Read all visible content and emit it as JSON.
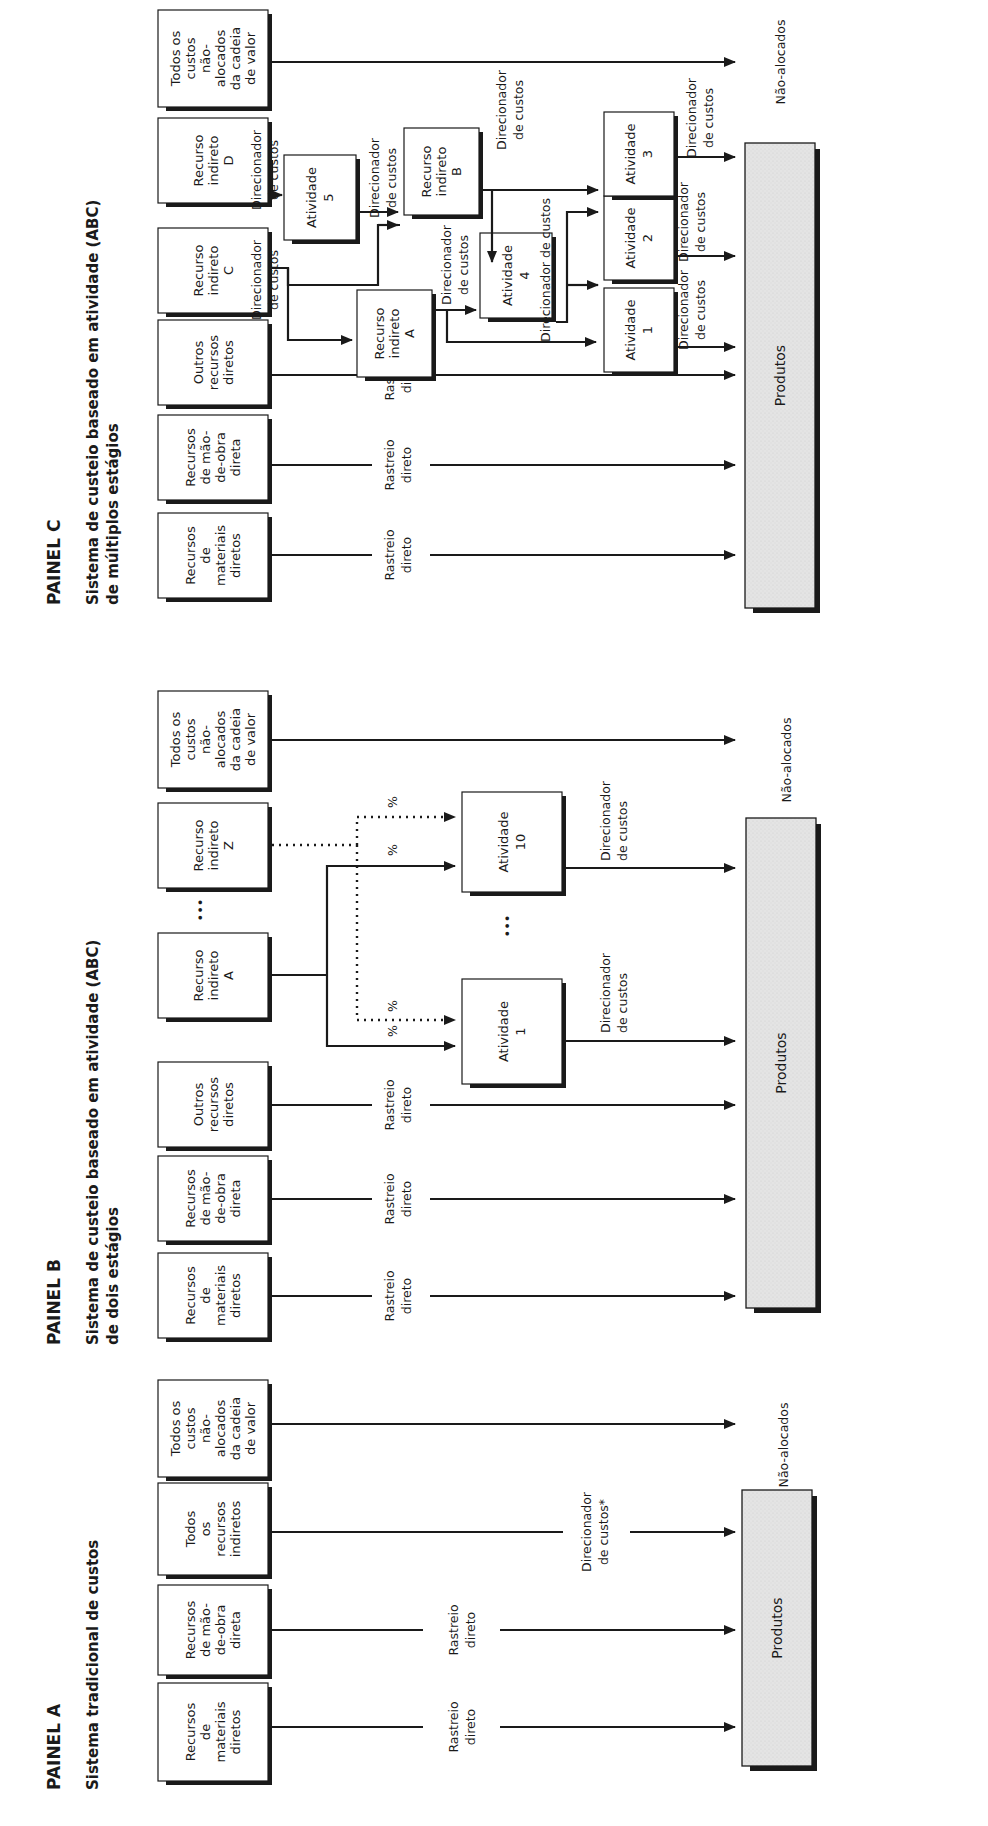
{
  "panels": {
    "a": {
      "title": "PAINEL A",
      "subtitle": [
        "Sistema tradicional de custos"
      ],
      "sources": [
        {
          "lines": [
            "Recursos",
            "de",
            "materiais",
            "diretos"
          ]
        },
        {
          "lines": [
            "Recursos",
            "de mão-",
            "de-obra",
            "direta"
          ]
        },
        {
          "lines": [
            "Todos",
            "os",
            "recursos",
            "indiretos"
          ]
        },
        {
          "lines": [
            "Todos os",
            "custos",
            "não-",
            "alocados",
            "da cadeia",
            "de valor"
          ]
        }
      ],
      "flow_labels": {
        "direct_1": [
          "Rastreio",
          "direto"
        ],
        "direct_2": [
          "Rastreio",
          "direto"
        ],
        "driver": [
          "Direcionador",
          "de custos*"
        ]
      },
      "products": "Produtos",
      "unallocated": "Não-alocados"
    },
    "b": {
      "title": "PAINEL B",
      "subtitle": [
        "Sistema de custeio baseado em atividade (ABC)",
        "de dois estágios"
      ],
      "sources": [
        {
          "lines": [
            "Recursos",
            "de",
            "materiais",
            "diretos"
          ]
        },
        {
          "lines": [
            "Recursos",
            "de mão-",
            "de-obra",
            "direta"
          ]
        },
        {
          "lines": [
            "Outros",
            "recursos",
            "diretos"
          ]
        },
        {
          "lines": [
            "Recurso",
            "indireto",
            "A"
          ]
        },
        {
          "lines": [
            "Recurso",
            "indireto",
            "Z"
          ]
        },
        {
          "lines": [
            "Todos os",
            "custos",
            "não-",
            "alocados",
            "da cadeia",
            "de valor"
          ]
        }
      ],
      "activities": [
        {
          "lines": [
            "Atividade",
            "1"
          ]
        },
        {
          "lines": [
            "Atividade",
            "10"
          ]
        }
      ],
      "flow_labels": {
        "direct": [
          "Rastreio",
          "direto"
        ],
        "driver": [
          "Direcionador",
          "de custos"
        ],
        "percent": "%"
      },
      "ellipsis": "•••",
      "products": "Produtos",
      "unallocated": "Não-alocados"
    },
    "c": {
      "title": "PAINEL C",
      "subtitle": [
        "Sistema de custeio baseado em atividade (ABC)",
        "de múltiplos estágios"
      ],
      "sources": [
        {
          "lines": [
            "Recursos",
            "de",
            "materiais",
            "diretos"
          ]
        },
        {
          "lines": [
            "Recursos",
            "de mão-",
            "de-obra",
            "direta"
          ]
        },
        {
          "lines": [
            "Outros",
            "recursos",
            "diretos"
          ]
        },
        {
          "lines": [
            "Recurso",
            "indireto",
            "C"
          ]
        },
        {
          "lines": [
            "Recurso",
            "indireto",
            "D"
          ]
        },
        {
          "lines": [
            "Todos os",
            "custos",
            "não-",
            "alocados",
            "da cadeia",
            "de valor"
          ]
        }
      ],
      "intermediate": [
        {
          "lines": [
            "Recurso",
            "indireto",
            "A"
          ]
        },
        {
          "lines": [
            "Recurso",
            "indireto",
            "B"
          ]
        }
      ],
      "activities": [
        {
          "lines": [
            "Atividade",
            "1"
          ]
        },
        {
          "lines": [
            "Atividade",
            "2"
          ]
        },
        {
          "lines": [
            "Atividade",
            "3"
          ]
        },
        {
          "lines": [
            "Atividade",
            "4"
          ]
        },
        {
          "lines": [
            "Atividade",
            "5"
          ]
        }
      ],
      "flow_labels": {
        "direct": [
          "Rastreio",
          "direto"
        ],
        "driver": [
          "Direcionador",
          "de custos"
        ],
        "driver_inline": "Direcionador de custos"
      },
      "products": "Produtos",
      "unallocated": "Não-alocados"
    }
  }
}
